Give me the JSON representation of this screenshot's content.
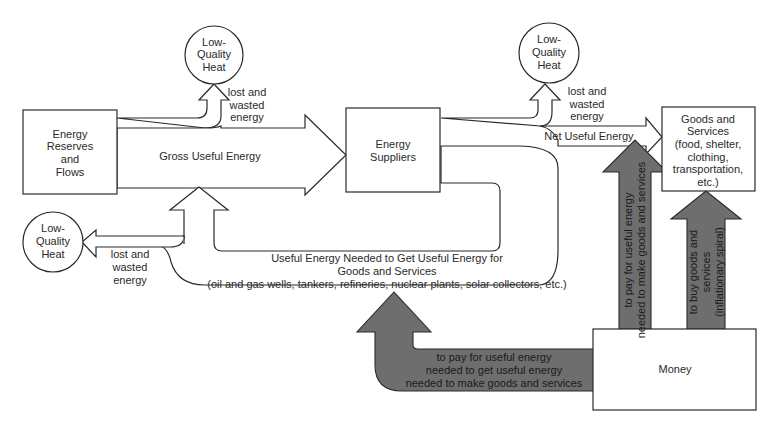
{
  "diagram": {
    "colors": {
      "background": "#ffffff",
      "stroke": "#2a2a2a",
      "money_flow_fill": "#6e6e6e",
      "text": "#2a2a2a"
    },
    "nodes": {
      "energy_reserves": {
        "lines": [
          "Energy",
          "Reserves",
          "and",
          "Flows"
        ]
      },
      "energy_suppliers": {
        "lines": [
          "Energy",
          "Suppliers"
        ]
      },
      "goods_services": {
        "lines": [
          "Goods  and",
          "Services",
          "(food, shelter,",
          "clothing,",
          "transportation,",
          "etc.)"
        ]
      },
      "money": {
        "label": "Money"
      },
      "heat_top_left": {
        "lines": [
          "Low-",
          "Quality",
          "Heat"
        ]
      },
      "heat_top_right": {
        "lines": [
          "Low-",
          "Quality",
          "Heat"
        ]
      },
      "heat_bottom_left": {
        "lines": [
          "Low-",
          "Quality",
          "Heat"
        ]
      }
    },
    "energy_flows": {
      "gross_useful_energy": "Gross Useful Energy",
      "net_useful_energy": "Net Useful Energy",
      "lost_wasted_top_left": [
        "lost and",
        "wasted",
        "energy"
      ],
      "lost_wasted_top_right": [
        "lost and",
        "wasted",
        "energy"
      ],
      "lost_wasted_bottom_left": [
        "lost  and",
        "wasted",
        "energy"
      ],
      "feedback_loop": [
        "Useful Energy Needed to Get Useful Energy for",
        "Goods and Services",
        "(oil and gas wells, tankers, refineries, nuclear plants, solar collectors, etc.)"
      ]
    },
    "money_flows": {
      "to_energy_for_energy": [
        "to pay for useful  energy",
        "needed to get useful energy",
        "needed  to make goods and services"
      ],
      "to_energy_for_goods": [
        "to pay for useful energy",
        "needed to make goods and services"
      ],
      "to_goods": [
        "to buy goods and",
        "services",
        "(inflationary spiral)"
      ]
    }
  }
}
